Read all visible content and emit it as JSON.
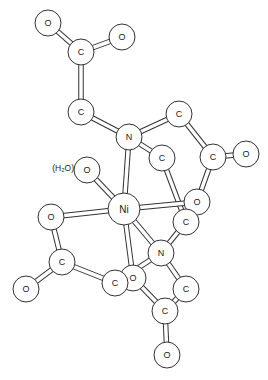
{
  "diagram": {
    "title": "",
    "atom_radius": 13,
    "colors": {
      "stroke": "#333333",
      "fill": "#ffffff",
      "text": "#222222"
    },
    "atoms": [
      {
        "id": "O1",
        "label": "O",
        "x": 48,
        "y": 23
      },
      {
        "id": "O2",
        "label": "O",
        "x": 122,
        "y": 37
      },
      {
        "id": "C1",
        "label": "C",
        "x": 81,
        "y": 52
      },
      {
        "id": "C2",
        "label": "C",
        "x": 81,
        "y": 112
      },
      {
        "id": "C3",
        "label": "C",
        "x": 179,
        "y": 114
      },
      {
        "id": "N1",
        "label": "N",
        "x": 129,
        "y": 137
      },
      {
        "id": "C4",
        "label": "C",
        "x": 162,
        "y": 158
      },
      {
        "id": "C5",
        "label": "C",
        "x": 213,
        "y": 157
      },
      {
        "id": "O3",
        "label": "O",
        "x": 246,
        "y": 154
      },
      {
        "id": "Ow",
        "label": "O",
        "x": 87,
        "y": 170
      },
      {
        "id": "Ni",
        "label": "Ni",
        "x": 124,
        "y": 209,
        "r": 16
      },
      {
        "id": "O4",
        "label": "O",
        "x": 197,
        "y": 202
      },
      {
        "id": "C6",
        "label": "C",
        "x": 186,
        "y": 222
      },
      {
        "id": "O5",
        "label": "O",
        "x": 51,
        "y": 217
      },
      {
        "id": "N2",
        "label": "N",
        "x": 161,
        "y": 253
      },
      {
        "id": "C7",
        "label": "C",
        "x": 62,
        "y": 262
      },
      {
        "id": "O6",
        "label": "O",
        "x": 133,
        "y": 278
      },
      {
        "id": "C8",
        "label": "C",
        "x": 115,
        "y": 283
      },
      {
        "id": "C9",
        "label": "C",
        "x": 186,
        "y": 289
      },
      {
        "id": "O7",
        "label": "O",
        "x": 26,
        "y": 289
      },
      {
        "id": "C10",
        "label": "C",
        "x": 165,
        "y": 311
      },
      {
        "id": "O8",
        "label": "O",
        "x": 167,
        "y": 355
      }
    ],
    "bonds": [
      [
        "O1",
        "C1"
      ],
      [
        "O2",
        "C1"
      ],
      [
        "C1",
        "C2"
      ],
      [
        "C2",
        "N1"
      ],
      [
        "N1",
        "C3"
      ],
      [
        "C3",
        "C5"
      ],
      [
        "C5",
        "O3"
      ],
      [
        "C5",
        "O4"
      ],
      [
        "N1",
        "C4"
      ],
      [
        "C4",
        "C6"
      ],
      [
        "N1",
        "Ni"
      ],
      [
        "Ow",
        "Ni"
      ],
      [
        "Ni",
        "O4"
      ],
      [
        "Ni",
        "O5"
      ],
      [
        "Ni",
        "N2"
      ],
      [
        "Ni",
        "O6"
      ],
      [
        "C6",
        "N2"
      ],
      [
        "O5",
        "C7"
      ],
      [
        "C7",
        "O7"
      ],
      [
        "C7",
        "C8"
      ],
      [
        "C8",
        "N2"
      ],
      [
        "N2",
        "C9"
      ],
      [
        "C9",
        "C10"
      ],
      [
        "C10",
        "O6"
      ],
      [
        "C10",
        "O8"
      ]
    ],
    "annotations": [
      {
        "id": "water-label",
        "text": "(H₂O)",
        "x": 74,
        "y": 168
      }
    ]
  }
}
